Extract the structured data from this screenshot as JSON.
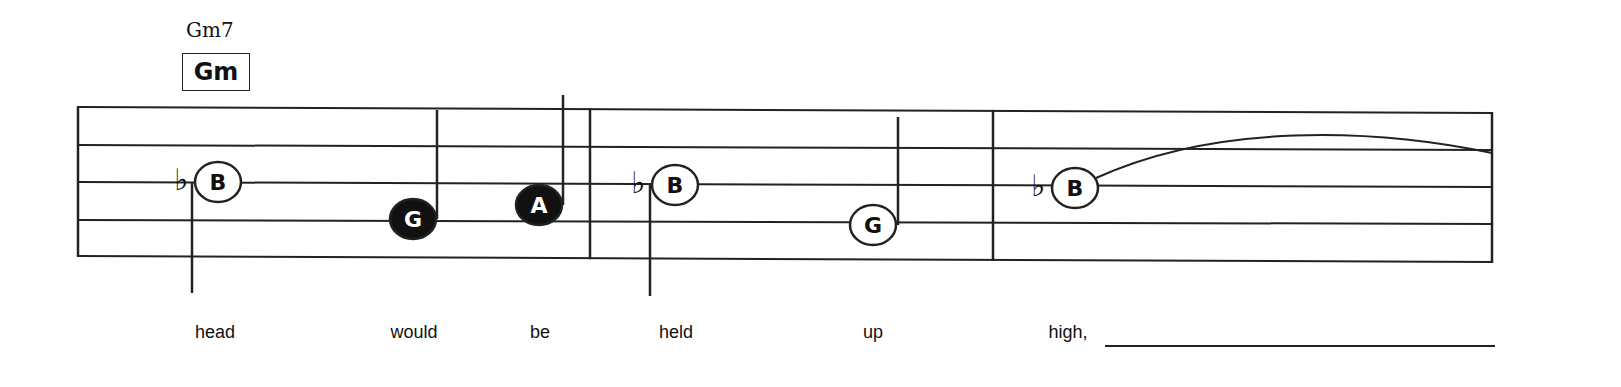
{
  "chord": {
    "name": "Gm7",
    "symbol": "Gm"
  },
  "staff": {
    "lines_left_y": [
      107,
      145,
      182,
      220,
      256
    ],
    "lines_right_y": [
      113,
      150,
      187,
      224,
      262
    ],
    "x_start": 78,
    "x_end": 1492,
    "barlines_x": [
      78,
      590,
      993,
      1492
    ],
    "color": "#222222"
  },
  "notes": [
    {
      "letter": "B",
      "accidental": "♭",
      "filled": false,
      "x": 218,
      "y": 182,
      "stem": "down",
      "stem_x": 192,
      "stem_end_y": 293
    },
    {
      "letter": "G",
      "accidental": "",
      "filled": true,
      "x": 413,
      "y": 219,
      "stem": "up",
      "stem_x": 437,
      "stem_end_y": 110
    },
    {
      "letter": "A",
      "accidental": "",
      "filled": true,
      "x": 539,
      "y": 205,
      "stem": "up",
      "stem_x": 563,
      "stem_end_y": 95
    },
    {
      "letter": "B",
      "accidental": "♭",
      "filled": false,
      "x": 675,
      "y": 185,
      "stem": "down",
      "stem_x": 650,
      "stem_end_y": 296
    },
    {
      "letter": "G",
      "accidental": "",
      "filled": false,
      "x": 873,
      "y": 225,
      "stem": "up",
      "stem_x": 898,
      "stem_end_y": 117
    },
    {
      "letter": "B",
      "accidental": "♭",
      "filled": false,
      "x": 1075,
      "y": 188,
      "stem": "none",
      "tie_to_x": 1492,
      "tie_to_y": 153
    }
  ],
  "lyrics": [
    {
      "text": "head",
      "x": 215
    },
    {
      "text": "would",
      "x": 414
    },
    {
      "text": "be",
      "x": 540
    },
    {
      "text": "held",
      "x": 676
    },
    {
      "text": "up",
      "x": 873
    },
    {
      "text": "high,",
      "x": 1068
    }
  ],
  "lyric_extender": {
    "x1": 1105,
    "x2": 1495,
    "y": 345
  }
}
